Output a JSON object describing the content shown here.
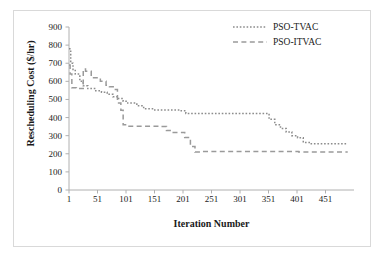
{
  "chart_data": {
    "type": "line",
    "title": "",
    "xlabel": "Iteration Number",
    "ylabel": "Rescheduling Cost ($/hr)",
    "xlim": [
      1,
      501
    ],
    "ylim": [
      0,
      900
    ],
    "xticks": [
      1,
      51,
      101,
      151,
      201,
      251,
      301,
      351,
      401,
      451
    ],
    "yticks": [
      0,
      100,
      200,
      300,
      400,
      500,
      600,
      700,
      800,
      900
    ],
    "grid": false,
    "legend_position": "top-right",
    "series": [
      {
        "name": "PSO-TVAC",
        "style": "dotted",
        "color": "#8c8c8c",
        "points": [
          [
            1,
            780
          ],
          [
            4,
            780
          ],
          [
            4,
            700
          ],
          [
            8,
            700
          ],
          [
            8,
            660
          ],
          [
            12,
            660
          ],
          [
            12,
            640
          ],
          [
            20,
            640
          ],
          [
            20,
            600
          ],
          [
            26,
            600
          ],
          [
            26,
            575
          ],
          [
            34,
            575
          ],
          [
            34,
            560
          ],
          [
            46,
            560
          ],
          [
            46,
            548
          ],
          [
            58,
            548
          ],
          [
            58,
            540
          ],
          [
            68,
            540
          ],
          [
            68,
            528
          ],
          [
            78,
            528
          ],
          [
            78,
            515
          ],
          [
            88,
            515
          ],
          [
            88,
            505
          ],
          [
            96,
            505
          ],
          [
            96,
            490
          ],
          [
            104,
            490
          ],
          [
            104,
            480
          ],
          [
            120,
            480
          ],
          [
            120,
            465
          ],
          [
            132,
            465
          ],
          [
            132,
            448
          ],
          [
            150,
            448
          ],
          [
            150,
            442
          ],
          [
            196,
            442
          ],
          [
            196,
            438
          ],
          [
            206,
            438
          ],
          [
            206,
            422
          ],
          [
            352,
            422
          ],
          [
            352,
            390
          ],
          [
            362,
            390
          ],
          [
            362,
            360
          ],
          [
            372,
            360
          ],
          [
            372,
            340
          ],
          [
            382,
            340
          ],
          [
            382,
            320
          ],
          [
            392,
            320
          ],
          [
            392,
            300
          ],
          [
            402,
            300
          ],
          [
            402,
            288
          ],
          [
            412,
            288
          ],
          [
            412,
            262
          ],
          [
            424,
            262
          ],
          [
            424,
            255
          ],
          [
            490,
            255
          ]
        ]
      },
      {
        "name": "PSO-ITVAC",
        "style": "dashed",
        "color": "#9a9a9a",
        "points": [
          [
            1,
            690
          ],
          [
            3,
            690
          ],
          [
            3,
            640
          ],
          [
            6,
            640
          ],
          [
            6,
            565
          ],
          [
            14,
            565
          ],
          [
            14,
            560
          ],
          [
            26,
            560
          ],
          [
            26,
            668
          ],
          [
            30,
            668
          ],
          [
            30,
            655
          ],
          [
            40,
            655
          ],
          [
            40,
            620
          ],
          [
            56,
            620
          ],
          [
            56,
            600
          ],
          [
            66,
            600
          ],
          [
            66,
            578
          ],
          [
            72,
            578
          ],
          [
            72,
            570
          ],
          [
            80,
            570
          ],
          [
            80,
            555
          ],
          [
            86,
            555
          ],
          [
            86,
            480
          ],
          [
            92,
            480
          ],
          [
            92,
            440
          ],
          [
            96,
            440
          ],
          [
            96,
            360
          ],
          [
            104,
            360
          ],
          [
            104,
            352
          ],
          [
            160,
            352
          ],
          [
            160,
            350
          ],
          [
            172,
            350
          ],
          [
            172,
            328
          ],
          [
            180,
            328
          ],
          [
            180,
            318
          ],
          [
            204,
            318
          ],
          [
            204,
            290
          ],
          [
            214,
            290
          ],
          [
            214,
            240
          ],
          [
            222,
            240
          ],
          [
            222,
            210
          ],
          [
            236,
            210
          ],
          [
            236,
            212
          ],
          [
            404,
            212
          ],
          [
            404,
            210
          ],
          [
            490,
            210
          ]
        ]
      }
    ]
  },
  "legend": {
    "items": [
      {
        "label": "PSO-TVAC",
        "style": "dotted"
      },
      {
        "label": "PSO-ITVAC",
        "style": "dashed"
      }
    ]
  }
}
